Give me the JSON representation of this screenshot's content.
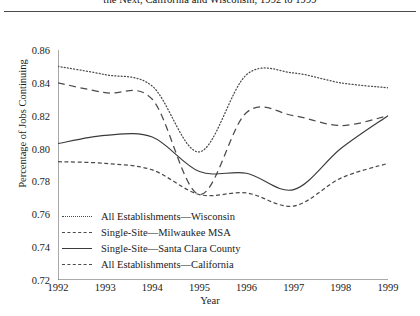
{
  "figure": {
    "title_visible_text": "the Next, California and Wisconsin, 1992 to 1999",
    "rule": "horizontal-rule"
  },
  "chart_data": {
    "type": "line",
    "title": "the Next, California and Wisconsin, 1992 to 1999",
    "xlabel": "Year",
    "ylabel": "Percentage of Jobs Continuing",
    "x": [
      1992,
      1993,
      1994,
      1995,
      1996,
      1997,
      1998,
      1999
    ],
    "xlim": [
      1992,
      1999
    ],
    "ylim": [
      0.72,
      0.86
    ],
    "yticks": [
      0.72,
      0.74,
      0.76,
      0.78,
      0.8,
      0.82,
      0.84,
      0.86
    ],
    "ytick_labels": [
      "0.72",
      "0.74",
      "0.76",
      "0.78",
      "0.80",
      "0.82",
      "0.84",
      "0.86"
    ],
    "xticks": [
      1992,
      1993,
      1994,
      1995,
      1996,
      1997,
      1998,
      1999
    ],
    "xtick_labels": [
      "1992",
      "1993",
      "1994",
      "1995",
      "1996",
      "1997",
      "1998",
      "1999"
    ],
    "grid": false,
    "legend_position": "lower-left-inside",
    "series": [
      {
        "name": "All Establishments—Wisconsin",
        "style": "dotted",
        "color": "#4b4b4b",
        "values": [
          0.85,
          0.845,
          0.838,
          0.798,
          0.845,
          0.846,
          0.84,
          0.837
        ]
      },
      {
        "name": "Single-Site—Milwaukee MSA",
        "style": "dashed",
        "color": "#4b4b4b",
        "values": [
          0.84,
          0.834,
          0.83,
          0.772,
          0.822,
          0.82,
          0.814,
          0.82
        ]
      },
      {
        "name": "Single-Site—Santa Clara County",
        "style": "solid",
        "color": "#3a3a3a",
        "values": [
          0.803,
          0.808,
          0.807,
          0.786,
          0.785,
          0.775,
          0.8,
          0.82
        ]
      },
      {
        "name": "All Establishments—California",
        "style": "dash-dot",
        "color": "#4b4b4b",
        "values": [
          0.792,
          0.791,
          0.787,
          0.772,
          0.773,
          0.765,
          0.782,
          0.791
        ]
      }
    ]
  },
  "legend": {
    "items": [
      {
        "label": "All Establishments—Wisconsin",
        "style": "dotted"
      },
      {
        "label": "Single-Site—Milwaukee MSA",
        "style": "dashed"
      },
      {
        "label": "Single-Site—Santa Clara County",
        "style": "solid"
      },
      {
        "label": "All Establishments—California",
        "style": "dash-dot"
      }
    ]
  }
}
